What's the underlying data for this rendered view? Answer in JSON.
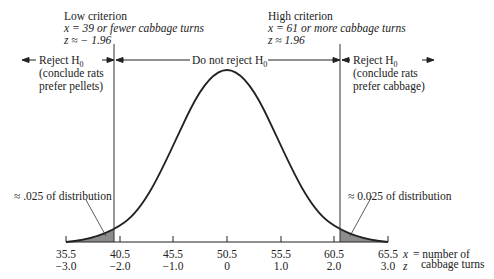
{
  "criteria": {
    "low": {
      "title": "Low criterion",
      "x_label": "x = 39 or fewer cabbage turns",
      "z_label": "z ≈ − 1.96"
    },
    "high": {
      "title": "High criterion",
      "x_label": "x = 61 or more cabbage turns",
      "z_label": "z ≈ 1.96"
    }
  },
  "regions": {
    "left_reject": {
      "line1": "Reject H",
      "sub": "0",
      "line2": "(conclude rats",
      "line3": "prefer pellets)"
    },
    "middle": {
      "label": "Do not reject H",
      "sub": "0"
    },
    "right_reject": {
      "line1": "Reject H",
      "sub": "0",
      "line2": "(conclude rats",
      "line3": "prefer cabbage)"
    }
  },
  "tail_labels": {
    "left": "≈ .025 of distribution",
    "right": "≈ 0.025 of distribution"
  },
  "axis": {
    "x_ticks": [
      "35.5",
      "40.5",
      "45.5",
      "50.5",
      "55.5",
      "60.5",
      "65.5"
    ],
    "z_ticks": [
      "−3.0",
      "−2.0",
      "−1.0",
      "0",
      "1.0",
      "2.0",
      "3.0"
    ],
    "x_var": "x",
    "x_desc_1": "= number of",
    "x_desc_2": "cabbage turns",
    "z_var": "z"
  },
  "colors": {
    "line": "#222222",
    "shade": "#8c8c8c"
  }
}
